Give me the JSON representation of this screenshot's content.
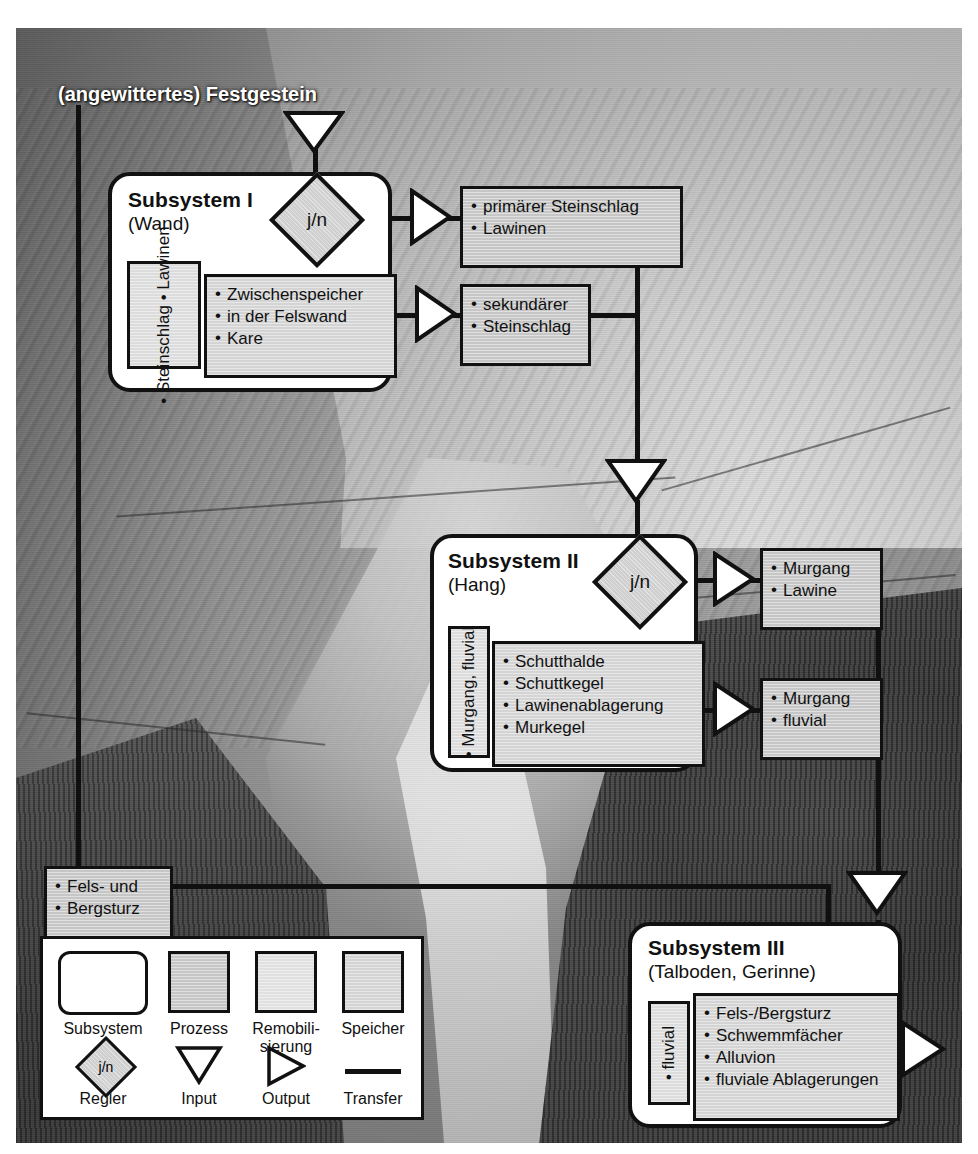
{
  "figure": {
    "kind": "system-diagram-over-photo",
    "top_label": "(angewittertes) Festgestein",
    "partial_caption_fragment": "",
    "controller_symbol": "j/n"
  },
  "subsystems": [
    {
      "id": "I",
      "title": "Subsystem I",
      "subtitle": "(Wand)",
      "remobilisation_label": "• Steinschlag    • Lawinen",
      "remobilisation_items": [
        "Steinschlag",
        "Lawinen"
      ],
      "storage_items": [
        "Zwischenspeicher",
        "in der Felswand",
        "Kare"
      ],
      "outputs": [
        {
          "items": [
            "primärer Steinschlag",
            "Lawinen"
          ]
        },
        {
          "items": [
            "sekundärer",
            "Steinschlag"
          ]
        }
      ]
    },
    {
      "id": "II",
      "title": "Subsystem II",
      "subtitle": "(Hang)",
      "remobilisation_label": "• Murgang, fluvial",
      "remobilisation_items": [
        "Murgang, fluvial"
      ],
      "storage_items": [
        "Schutthalde",
        "Schuttkegel",
        "Lawinenablagerung",
        "Murkegel"
      ],
      "outputs": [
        {
          "items": [
            "Murgang",
            "Lawine"
          ]
        },
        {
          "items": [
            "Murgang",
            "fluvial"
          ]
        }
      ]
    },
    {
      "id": "III",
      "title": "Subsystem III",
      "subtitle": "(Talboden, Gerinne)",
      "remobilisation_label": "• fluvial",
      "remobilisation_items": [
        "fluvial"
      ],
      "storage_items": [
        "Fels-/Bergsturz",
        "Schwemmfächer",
        "Alluvion",
        "fluviale Ablagerungen"
      ],
      "outputs": []
    }
  ],
  "side_process": {
    "items": [
      "Fels- und",
      "Bergsturz"
    ]
  },
  "legend": {
    "row1": [
      {
        "label": "Subsystem",
        "shape": "rounded-rect-white"
      },
      {
        "label": "Prozess",
        "shape": "square-dark-gray"
      },
      {
        "label_line1": "Remobili-",
        "label_line2": "sierung",
        "label": "Remobili-sierung",
        "shape": "square-light-gray"
      },
      {
        "label": "Speicher",
        "shape": "square-gray"
      }
    ],
    "row2": [
      {
        "label": "Regler",
        "shape": "diamond",
        "text": "j/n"
      },
      {
        "label": "Input",
        "shape": "triangle-down"
      },
      {
        "label": "Output",
        "shape": "triangle-right"
      },
      {
        "label": "Transfer",
        "shape": "thick-line"
      }
    ]
  },
  "colors": {
    "stroke": "#111111",
    "process_fill": "#c6c6c6",
    "storage_fill": "#d4d4d4",
    "remobilisation_fill": "#dcdcdc",
    "controller_fill": "#cfcfcf",
    "subsystem_fill": "#ffffff",
    "label_text": "#ffffff"
  }
}
